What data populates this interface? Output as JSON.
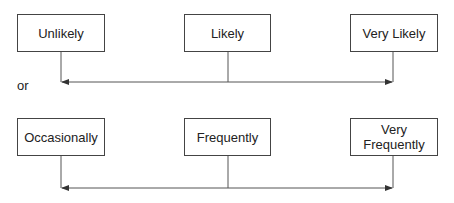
{
  "diagram": {
    "scale_one": {
      "boxes": [
        {
          "label": "Unlikely"
        },
        {
          "label": "Likely"
        },
        {
          "label": "Very Likely"
        }
      ]
    },
    "separator_label": "or",
    "scale_two": {
      "boxes": [
        {
          "label": "Occasionally"
        },
        {
          "label": "Frequently"
        },
        {
          "label": "Very\nFrequently"
        }
      ]
    },
    "colors": {
      "line": "#444444",
      "text": "#222222",
      "background": "#ffffff"
    }
  }
}
